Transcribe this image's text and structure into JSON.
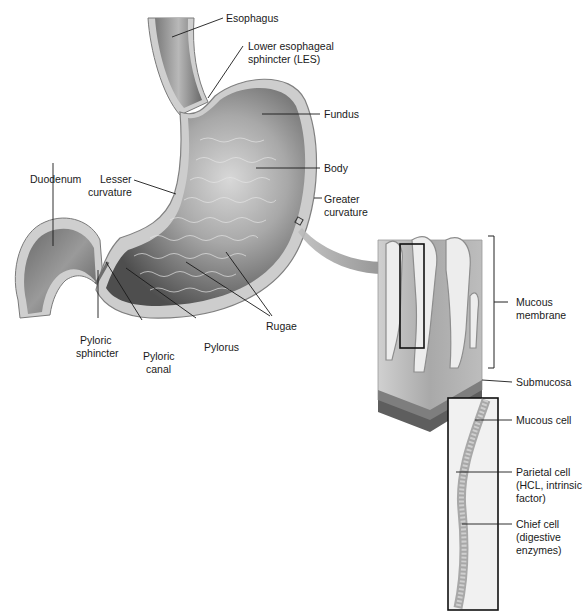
{
  "figure": {
    "labels": {
      "esophagus": "Esophagus",
      "les_line1": "Lower esophageal",
      "les_line2": "sphincter (LES)",
      "fundus": "Fundus",
      "body": "Body",
      "greater_line1": "Greater",
      "greater_line2": "curvature",
      "duodenum": "Duodenum",
      "lesser_line1": "Lesser",
      "lesser_line2": "curvature",
      "pyloric_sphincter_line1": "Pyloric",
      "pyloric_sphincter_line2": "sphincter",
      "pyloric_canal_line1": "Pyloric",
      "pyloric_canal_line2": "canal",
      "pylorus": "Pylorus",
      "rugae": "Rugae",
      "mucous_membrane_line1": "Mucous",
      "mucous_membrane_line2": "membrane",
      "submucosa": "Submucosa",
      "mucous_cell": "Mucous cell",
      "parietal_line1": "Parietal cell",
      "parietal_line2": "(HCL, intrinsic",
      "parietal_line3": "factor)",
      "chief_line1": "Chief cell",
      "chief_line2": "(digestive",
      "chief_line3": "enzymes)"
    },
    "colors": {
      "stomach_wall": "#c8c8c8",
      "stomach_interior_dark": "#5a5a5a",
      "stomach_interior_light": "#bdbdbd",
      "arrow": "#8a8a8a",
      "leader_line": "#1a1a1a"
    }
  }
}
